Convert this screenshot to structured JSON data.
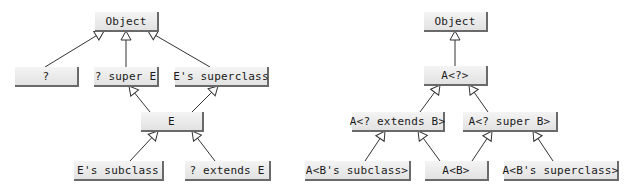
{
  "diagrams": [
    {
      "name": "wildcard-type-relationships",
      "nodes": {
        "object": "Object",
        "unbounded": "?",
        "super_e": "? super E",
        "e_superclass": "E's superclass",
        "e": "E",
        "e_subclass": "E's subclass",
        "extends_e": "? extends E"
      },
      "edges": [
        {
          "from": "?",
          "to": "Object"
        },
        {
          "from": "? super E",
          "to": "Object"
        },
        {
          "from": "E's superclass",
          "to": "Object"
        },
        {
          "from": "E",
          "to": "? super E"
        },
        {
          "from": "E",
          "to": "E's superclass"
        },
        {
          "from": "E's subclass",
          "to": "E"
        },
        {
          "from": "? extends E",
          "to": "E"
        }
      ]
    },
    {
      "name": "generic-wildcard-relationships",
      "nodes": {
        "object": "Object",
        "a_unbounded": "A<?>",
        "a_extends_b": "A<? extends B>",
        "a_super_b": "A<? super B>",
        "a_b_subclass": "A<B's subclass>",
        "a_b": "A<B>",
        "a_b_superclass": "A<B's superclass>"
      },
      "edges": [
        {
          "from": "A<?>",
          "to": "Object"
        },
        {
          "from": "A<? extends B>",
          "to": "A<?>"
        },
        {
          "from": "A<? super B>",
          "to": "A<?>"
        },
        {
          "from": "A<B's subclass>",
          "to": "A<? extends B>"
        },
        {
          "from": "A<B>",
          "to": "A<? extends B>"
        },
        {
          "from": "A<B>",
          "to": "A<? super B>"
        },
        {
          "from": "A<B's superclass>",
          "to": "A<? super B>"
        }
      ]
    }
  ],
  "colors": {
    "box_fill": "#e8e8e8",
    "box_shadow": "#6a6a6a",
    "line": "#333333",
    "text": "#1a1a1a"
  }
}
